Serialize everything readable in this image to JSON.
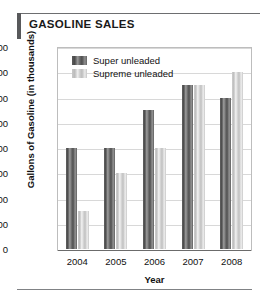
{
  "title": "GASOLINE SALES",
  "chart_data": {
    "type": "bar",
    "title": "GASOLINE SALES",
    "xlabel": "Year",
    "ylabel": "Gallons of Gasoline (in thousands)",
    "categories": [
      "2004",
      "2005",
      "2006",
      "2007",
      "2008"
    ],
    "series": [
      {
        "name": "Super unleaded",
        "color": "#5f5f5f",
        "values": [
          400,
          400,
          550,
          650,
          600
        ]
      },
      {
        "name": "Supreme unleaded",
        "color": "#cdcdcd",
        "values": [
          150,
          300,
          400,
          650,
          700
        ]
      }
    ],
    "ylim": [
      0,
      800
    ],
    "yticks": [
      0,
      100,
      200,
      300,
      400,
      500,
      600,
      700,
      800
    ],
    "ytick_labels": [
      "0",
      "100",
      "200",
      "300",
      "400",
      "500",
      "600",
      "700",
      "800"
    ],
    "grid": true,
    "legend_position": "top-left-inside"
  },
  "legend": [
    {
      "label": "Super unleaded",
      "swatch": "super-unleaded-swatch"
    },
    {
      "label": "Supreme unleaded",
      "swatch": "supreme-unleaded-swatch"
    }
  ]
}
